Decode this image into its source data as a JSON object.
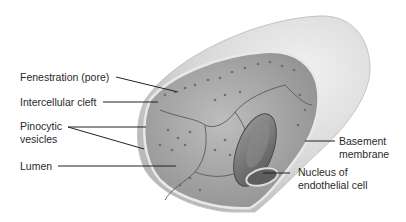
{
  "figure": {
    "labels_left": [
      {
        "id": "fenestration",
        "text": "Fenestration (pore)"
      },
      {
        "id": "cleft",
        "text": "Intercellular cleft"
      },
      {
        "id": "pinocytic_1",
        "text": "Pinocytic"
      },
      {
        "id": "pinocytic_2",
        "text": "vesicles"
      },
      {
        "id": "lumen",
        "text": "Lumen"
      }
    ],
    "labels_right": [
      {
        "id": "basement_1",
        "text": "Basement"
      },
      {
        "id": "basement_2",
        "text": "membrane"
      },
      {
        "id": "nucleus_1",
        "text": "Nucleus of"
      },
      {
        "id": "nucleus_2",
        "text": "endothelial cell"
      }
    ],
    "colors": {
      "outer_tube": "#d9d9d9",
      "inner_wall": "#a8a8a8",
      "cell_border": "#5a5a5a",
      "rbc": "#7a7a7a",
      "leader_line": "#222222",
      "text": "#2a2a2a"
    }
  }
}
